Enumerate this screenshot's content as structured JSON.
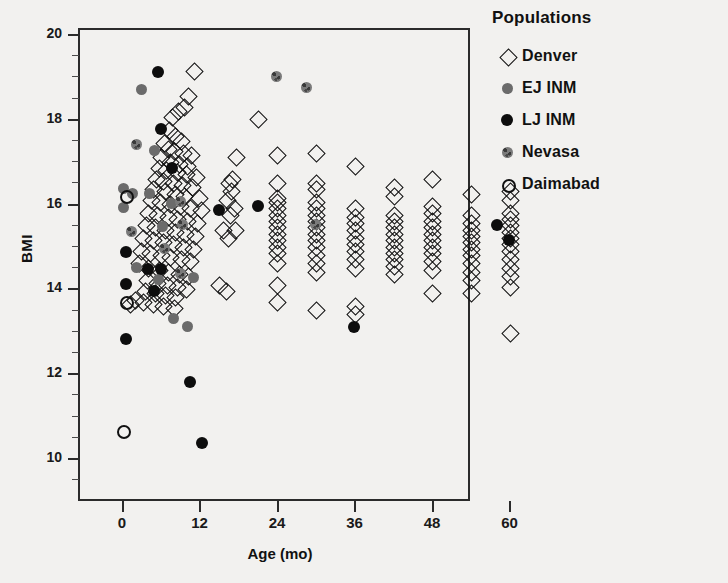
{
  "chart_data": {
    "type": "scatter",
    "title": "",
    "xlabel": "Age (mo)",
    "ylabel": "BMI",
    "xlim": [
      -6,
      66
    ],
    "ylim": [
      9.1,
      20.6
    ],
    "xticks": [
      0,
      12,
      24,
      36,
      48,
      60
    ],
    "yticks": [
      10,
      12,
      14,
      16,
      18,
      20
    ],
    "grid": false,
    "legend_position": "right",
    "legend_title": "Populations",
    "series": [
      {
        "name": "Denver",
        "marker": "open-diamond",
        "color": "#111111",
        "points": [
          [
            11.0,
            19.15
          ],
          [
            10.2,
            18.55
          ],
          [
            9.6,
            18.3
          ],
          [
            8.6,
            18.2
          ],
          [
            7.6,
            18.05
          ],
          [
            21.0,
            18.0
          ],
          [
            7.2,
            17.75
          ],
          [
            8.2,
            17.6
          ],
          [
            9.0,
            17.5
          ],
          [
            6.4,
            17.45
          ],
          [
            7.0,
            17.3
          ],
          [
            8.0,
            17.25
          ],
          [
            9.4,
            17.2
          ],
          [
            10.6,
            17.15
          ],
          [
            6.0,
            17.1
          ],
          [
            7.4,
            17.0
          ],
          [
            8.8,
            16.95
          ],
          [
            10.0,
            16.9
          ],
          [
            5.6,
            16.85
          ],
          [
            6.8,
            16.8
          ],
          [
            8.4,
            16.75
          ],
          [
            9.8,
            16.7
          ],
          [
            11.4,
            16.65
          ],
          [
            5.2,
            16.6
          ],
          [
            6.2,
            16.55
          ],
          [
            7.8,
            16.5
          ],
          [
            9.2,
            16.45
          ],
          [
            10.8,
            16.4
          ],
          [
            4.8,
            16.35
          ],
          [
            6.6,
            16.3
          ],
          [
            8.1,
            16.25
          ],
          [
            9.6,
            16.2
          ],
          [
            11.8,
            16.15
          ],
          [
            4.4,
            16.1
          ],
          [
            5.8,
            16.05
          ],
          [
            7.3,
            16.0
          ],
          [
            8.9,
            15.95
          ],
          [
            10.4,
            15.9
          ],
          [
            12.2,
            15.85
          ],
          [
            4.0,
            15.8
          ],
          [
            5.4,
            15.75
          ],
          [
            7.0,
            15.7
          ],
          [
            8.5,
            15.65
          ],
          [
            10.0,
            15.6
          ],
          [
            11.6,
            15.55
          ],
          [
            3.6,
            15.5
          ],
          [
            5.0,
            15.45
          ],
          [
            6.6,
            15.4
          ],
          [
            8.2,
            15.35
          ],
          [
            9.7,
            15.3
          ],
          [
            11.2,
            15.25
          ],
          [
            3.2,
            15.2
          ],
          [
            4.7,
            15.15
          ],
          [
            6.2,
            15.1
          ],
          [
            7.8,
            15.05
          ],
          [
            9.3,
            15.0
          ],
          [
            10.9,
            14.95
          ],
          [
            2.8,
            14.9
          ],
          [
            4.3,
            14.85
          ],
          [
            5.9,
            14.8
          ],
          [
            7.4,
            14.75
          ],
          [
            9.0,
            14.7
          ],
          [
            10.5,
            14.65
          ],
          [
            2.6,
            14.6
          ],
          [
            4.0,
            14.5
          ],
          [
            5.6,
            14.45
          ],
          [
            7.1,
            14.4
          ],
          [
            8.7,
            14.35
          ],
          [
            10.2,
            14.3
          ],
          [
            3.8,
            14.2
          ],
          [
            5.3,
            14.15
          ],
          [
            6.9,
            14.1
          ],
          [
            8.4,
            14.05
          ],
          [
            9.9,
            14.0
          ],
          [
            3.5,
            13.95
          ],
          [
            5.0,
            13.9
          ],
          [
            6.6,
            13.85
          ],
          [
            8.1,
            13.8
          ],
          [
            3.2,
            13.7
          ],
          [
            4.7,
            13.65
          ],
          [
            6.3,
            13.6
          ],
          [
            7.9,
            13.55
          ],
          [
            2.0,
            13.75
          ],
          [
            1.2,
            13.65
          ],
          [
            17.5,
            17.1
          ],
          [
            17.0,
            16.6
          ],
          [
            16.5,
            16.5
          ],
          [
            16.8,
            16.3
          ],
          [
            16.2,
            16.1
          ],
          [
            17.2,
            15.9
          ],
          [
            16.6,
            15.75
          ],
          [
            17.4,
            15.4
          ],
          [
            16.4,
            15.2
          ],
          [
            15.6,
            15.4
          ],
          [
            15.0,
            14.1
          ],
          [
            16.0,
            13.95
          ],
          [
            24.0,
            17.15
          ],
          [
            24.0,
            16.5
          ],
          [
            24.0,
            16.15
          ],
          [
            24.0,
            16.05
          ],
          [
            24.0,
            15.9
          ],
          [
            24.0,
            15.75
          ],
          [
            24.0,
            15.6
          ],
          [
            24.0,
            15.45
          ],
          [
            24.0,
            15.3
          ],
          [
            24.0,
            15.15
          ],
          [
            24.0,
            15.0
          ],
          [
            24.0,
            14.85
          ],
          [
            24.0,
            14.6
          ],
          [
            24.0,
            14.1
          ],
          [
            24.0,
            13.7
          ],
          [
            30.0,
            17.2
          ],
          [
            30.0,
            16.5
          ],
          [
            30.0,
            16.35
          ],
          [
            30.0,
            16.05
          ],
          [
            30.0,
            15.9
          ],
          [
            30.0,
            15.75
          ],
          [
            30.0,
            15.6
          ],
          [
            30.0,
            15.45
          ],
          [
            30.0,
            15.3
          ],
          [
            30.0,
            15.15
          ],
          [
            30.0,
            15.0
          ],
          [
            30.0,
            14.8
          ],
          [
            30.0,
            14.6
          ],
          [
            30.0,
            14.4
          ],
          [
            30.0,
            13.5
          ],
          [
            36.0,
            16.9
          ],
          [
            36.0,
            15.9
          ],
          [
            36.0,
            15.7
          ],
          [
            36.0,
            15.55
          ],
          [
            36.0,
            15.4
          ],
          [
            36.0,
            15.2
          ],
          [
            36.0,
            15.05
          ],
          [
            36.0,
            14.9
          ],
          [
            36.0,
            14.7
          ],
          [
            36.0,
            14.5
          ],
          [
            36.0,
            13.6
          ],
          [
            36.0,
            13.4
          ],
          [
            42.0,
            16.4
          ],
          [
            42.0,
            16.2
          ],
          [
            42.0,
            15.75
          ],
          [
            42.0,
            15.6
          ],
          [
            42.0,
            15.45
          ],
          [
            42.0,
            15.3
          ],
          [
            42.0,
            15.15
          ],
          [
            42.0,
            15.0
          ],
          [
            42.0,
            14.85
          ],
          [
            42.0,
            14.7
          ],
          [
            42.0,
            14.55
          ],
          [
            42.0,
            14.35
          ],
          [
            48.0,
            16.6
          ],
          [
            48.0,
            15.95
          ],
          [
            48.0,
            15.8
          ],
          [
            48.0,
            15.6
          ],
          [
            48.0,
            15.45
          ],
          [
            48.0,
            15.3
          ],
          [
            48.0,
            15.15
          ],
          [
            48.0,
            15.0
          ],
          [
            48.0,
            14.85
          ],
          [
            48.0,
            14.65
          ],
          [
            48.0,
            14.45
          ],
          [
            48.0,
            13.9
          ],
          [
            54.0,
            16.25
          ],
          [
            54.0,
            15.75
          ],
          [
            54.0,
            15.55
          ],
          [
            54.0,
            15.4
          ],
          [
            54.0,
            15.25
          ],
          [
            54.0,
            15.1
          ],
          [
            54.0,
            14.95
          ],
          [
            54.0,
            14.8
          ],
          [
            54.0,
            14.6
          ],
          [
            54.0,
            14.4
          ],
          [
            54.0,
            14.2
          ],
          [
            54.0,
            13.9
          ],
          [
            60.0,
            16.3
          ],
          [
            60.0,
            16.1
          ],
          [
            60.0,
            15.8
          ],
          [
            60.0,
            15.65
          ],
          [
            60.0,
            15.5
          ],
          [
            60.0,
            15.35
          ],
          [
            60.0,
            15.2
          ],
          [
            60.0,
            15.05
          ],
          [
            60.0,
            14.9
          ],
          [
            60.0,
            14.7
          ],
          [
            60.0,
            14.5
          ],
          [
            60.0,
            14.3
          ],
          [
            60.0,
            14.05
          ],
          [
            60.0,
            12.95
          ]
        ]
      },
      {
        "name": "EJ INM",
        "marker": "gray-circle",
        "color": "#6b6b6b",
        "points": [
          [
            0.2,
            16.35
          ],
          [
            0.2,
            15.9
          ],
          [
            3.0,
            18.7
          ],
          [
            5.0,
            17.25
          ],
          [
            1.6,
            16.25
          ],
          [
            4.2,
            16.25
          ],
          [
            7.6,
            16.0
          ],
          [
            6.2,
            15.45
          ],
          [
            2.2,
            14.5
          ],
          [
            5.6,
            14.2
          ],
          [
            11.0,
            14.25
          ],
          [
            8.0,
            13.3
          ],
          [
            10.2,
            13.1
          ]
        ]
      },
      {
        "name": "LJ INM",
        "marker": "black-circle",
        "color": "#0d0d0d",
        "points": [
          [
            5.6,
            19.1
          ],
          [
            6.0,
            17.75
          ],
          [
            7.8,
            16.85
          ],
          [
            0.6,
            14.85
          ],
          [
            0.6,
            14.1
          ],
          [
            4.0,
            14.45
          ],
          [
            6.0,
            14.45
          ],
          [
            5.0,
            13.95
          ],
          [
            0.6,
            12.8
          ],
          [
            10.6,
            11.8
          ],
          [
            12.4,
            10.35
          ],
          [
            21.0,
            15.95
          ],
          [
            15.0,
            15.85
          ],
          [
            36.0,
            13.1
          ],
          [
            58.0,
            15.5
          ],
          [
            60.0,
            15.15
          ]
        ]
      },
      {
        "name": "Nevasa",
        "marker": "speckled-circle",
        "color": "#7a7a7a",
        "points": [
          [
            24.0,
            19.0
          ],
          [
            28.5,
            18.75
          ],
          [
            2.2,
            17.4
          ],
          [
            9.0,
            16.05
          ],
          [
            9.4,
            15.5
          ],
          [
            1.4,
            15.35
          ],
          [
            6.6,
            14.95
          ],
          [
            9.0,
            14.35
          ],
          [
            30.0,
            15.5
          ]
        ]
      },
      {
        "name": "Daimabad",
        "marker": "open-circle",
        "color": "#111111",
        "points": [
          [
            0.4,
            16.2
          ],
          [
            0.4,
            13.7
          ],
          [
            0.0,
            10.65
          ]
        ]
      }
    ]
  },
  "axes": {
    "y_title": "BMI",
    "x_title": "Age (mo)",
    "y_tick_labels": [
      "10",
      "12",
      "14",
      "16",
      "18",
      "20"
    ],
    "x_tick_labels": [
      "0",
      "12",
      "24",
      "36",
      "48",
      "60"
    ]
  },
  "legend": {
    "title": "Populations",
    "items": [
      {
        "label": "Denver",
        "marker": "open-diamond"
      },
      {
        "label": "EJ INM",
        "marker": "gray-circle"
      },
      {
        "label": "LJ INM",
        "marker": "black-circle"
      },
      {
        "label": "Nevasa",
        "marker": "speckled-circle"
      },
      {
        "label": "Daimabad",
        "marker": "open-circle"
      }
    ]
  },
  "background_text": {
    "right_block": "",
    "left_block": "",
    "bottom_block": ""
  }
}
